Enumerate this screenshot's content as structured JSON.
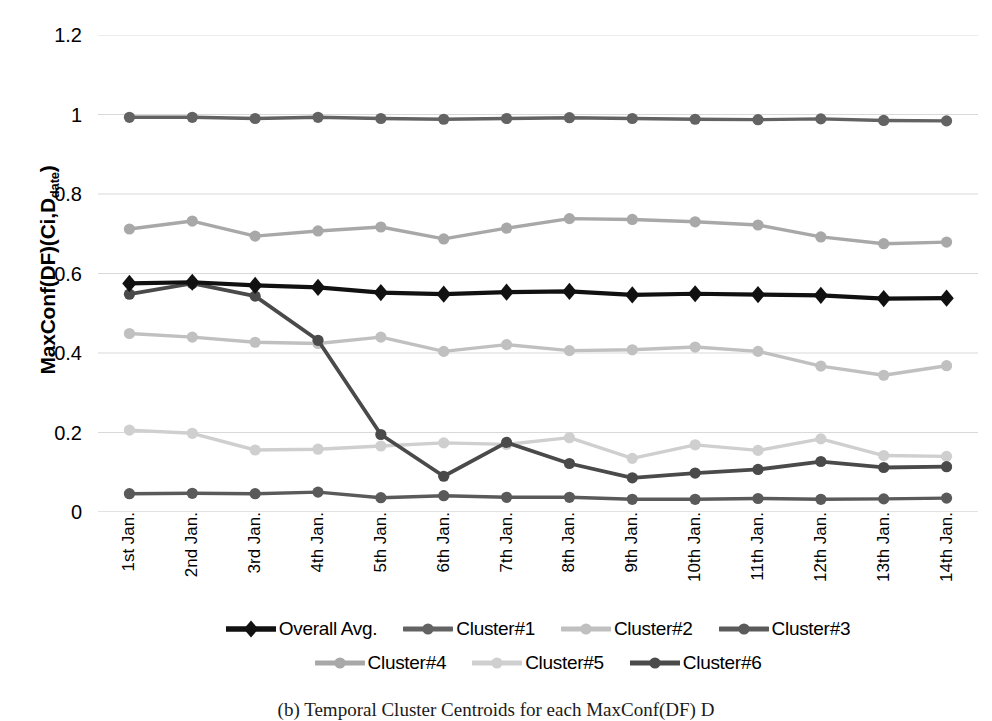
{
  "chart_data": {
    "type": "line",
    "title": "",
    "xlabel": "",
    "ylabel": "MaxConf(DF)(Ci,Ddate)",
    "ylabel_main": "MaxConf(DF)(Ci,D",
    "ylabel_sub": "date",
    "ylabel_tail": ")",
    "ylim": [
      0,
      1.2
    ],
    "ytick_labels": [
      "1.2",
      "1",
      "0.8",
      "0.6",
      "0.4",
      "0.2",
      "0"
    ],
    "ytick_values": [
      1.2,
      1.0,
      0.8,
      0.6,
      0.4,
      0.2,
      0
    ],
    "grid": true,
    "legend_position": "bottom",
    "categories": [
      "1st Jan.",
      "2nd Jan.",
      "3rd Jan.",
      "4th Jan.",
      "5th Jan.",
      "6th Jan.",
      "7th Jan.",
      "8th Jan.",
      "9th Jan.",
      "10th Jan.",
      "11th Jan.",
      "12th Jan.",
      "13th Jan.",
      "14th Jan."
    ],
    "series": [
      {
        "name": "Overall Avg.",
        "color": "#111111",
        "marker": "diamond",
        "width": 4.2,
        "values": [
          0.575,
          0.578,
          0.57,
          0.565,
          0.552,
          0.548,
          0.553,
          0.555,
          0.546,
          0.549,
          0.547,
          0.545,
          0.537,
          0.538
        ]
      },
      {
        "name": "Cluster#1",
        "color": "#636363",
        "marker": "circle",
        "width": 3.4,
        "values": [
          0.993,
          0.993,
          0.99,
          0.993,
          0.99,
          0.988,
          0.99,
          0.992,
          0.99,
          0.988,
          0.987,
          0.989,
          0.985,
          0.984
        ]
      },
      {
        "name": "Cluster#2",
        "color": "#c0c0c0",
        "marker": "circle",
        "width": 3.4,
        "values": [
          0.449,
          0.44,
          0.427,
          0.424,
          0.44,
          0.404,
          0.421,
          0.406,
          0.408,
          0.415,
          0.404,
          0.367,
          0.344,
          0.368
        ]
      },
      {
        "name": "Cluster#3",
        "color": "#5a5a5a",
        "marker": "circle",
        "width": 3.4,
        "values": [
          0.046,
          0.047,
          0.046,
          0.05,
          0.036,
          0.041,
          0.037,
          0.037,
          0.032,
          0.032,
          0.034,
          0.032,
          0.033,
          0.035
        ]
      },
      {
        "name": "Cluster#4",
        "color": "#a8a8a8",
        "marker": "circle",
        "width": 3.4,
        "values": [
          0.712,
          0.732,
          0.694,
          0.707,
          0.717,
          0.687,
          0.714,
          0.738,
          0.736,
          0.73,
          0.722,
          0.692,
          0.675,
          0.679
        ]
      },
      {
        "name": "Cluster#5",
        "color": "#cfcfcf",
        "marker": "circle",
        "width": 3.4,
        "values": [
          0.206,
          0.198,
          0.156,
          0.158,
          0.166,
          0.174,
          0.17,
          0.187,
          0.135,
          0.169,
          0.155,
          0.184,
          0.142,
          0.14
        ]
      },
      {
        "name": "Cluster#6",
        "color": "#4a4a4a",
        "marker": "circle",
        "width": 3.8,
        "values": [
          0.548,
          0.575,
          0.543,
          0.432,
          0.195,
          0.09,
          0.175,
          0.122,
          0.086,
          0.098,
          0.107,
          0.127,
          0.112,
          0.114
        ]
      }
    ]
  },
  "legend": {
    "rows": [
      [
        "Overall Avg.",
        "Cluster#1",
        "Cluster#2",
        "Cluster#3"
      ],
      [
        "Cluster#4",
        "Cluster#5",
        "Cluster#6"
      ]
    ]
  },
  "caption": {
    "text": "(b) Temporal Cluster Centroids for each MaxConf(DF) D"
  }
}
